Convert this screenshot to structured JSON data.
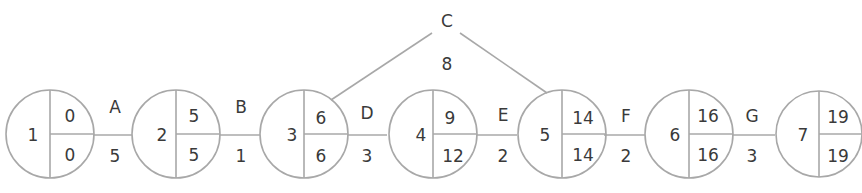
{
  "diagram": {
    "type": "activity-on-arrow network",
    "line_color": "#a8a8a8",
    "text_color": "#3a3a3a",
    "nodes": [
      {
        "id": "1",
        "earliest": "0",
        "latest": "0"
      },
      {
        "id": "2",
        "earliest": "5",
        "latest": "5"
      },
      {
        "id": "3",
        "earliest": "6",
        "latest": "6"
      },
      {
        "id": "4",
        "earliest": "9",
        "latest": "12"
      },
      {
        "id": "5",
        "earliest": "14",
        "latest": "14"
      },
      {
        "id": "6",
        "earliest": "16",
        "latest": "16"
      },
      {
        "id": "7",
        "earliest": "19",
        "latest": "19"
      }
    ],
    "activities": [
      {
        "name": "A",
        "duration": "5",
        "from": "1",
        "to": "2"
      },
      {
        "name": "B",
        "duration": "1",
        "from": "2",
        "to": "3"
      },
      {
        "name": "C",
        "duration": "8",
        "from": "3",
        "to": "5"
      },
      {
        "name": "D",
        "duration": "3",
        "from": "3",
        "to": "4"
      },
      {
        "name": "E",
        "duration": "2",
        "from": "4",
        "to": "5"
      },
      {
        "name": "F",
        "duration": "2",
        "from": "5",
        "to": "6"
      },
      {
        "name": "G",
        "duration": "3",
        "from": "6",
        "to": "7"
      }
    ]
  }
}
